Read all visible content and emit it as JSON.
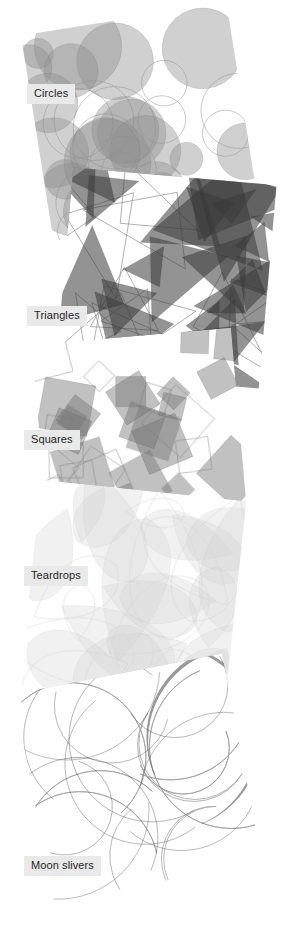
{
  "figure": {
    "background_color": "#ffffff",
    "width": 287,
    "height": 939,
    "label_chip": {
      "background_color": "#e9e9e9",
      "text_color": "#1f1f1f",
      "font_size_px": 11
    }
  },
  "panels": [
    {
      "id": "circles",
      "label": "Circles",
      "shape_kind": "circle",
      "tone": "medium-light",
      "fill_color": "#8f8f8f",
      "outline_color": "#707070",
      "shape_opacity": 0.42,
      "shape_count": 22,
      "rotation_deg": -9,
      "left": 36,
      "top": 18,
      "size": 208,
      "label_left": 27,
      "label_top": 84
    },
    {
      "id": "triangles",
      "label": "Triangles",
      "shape_kind": "triangle",
      "tone": "dark",
      "fill_color": "#3a3a3a",
      "outline_color": "#2a2a2a",
      "shape_opacity": 0.55,
      "shape_count": 26,
      "rotation_deg": 5,
      "left": 64,
      "top": 176,
      "size": 204,
      "label_left": 27,
      "label_top": 306
    },
    {
      "id": "squares",
      "label": "Squares",
      "shape_kind": "square",
      "tone": "medium",
      "fill_color": "#767676",
      "outline_color": "#5a5a5a",
      "shape_opacity": 0.45,
      "shape_count": 24,
      "rotation_deg": -5,
      "left": 40,
      "top": 336,
      "size": 200,
      "label_left": 24,
      "label_top": 430
    },
    {
      "id": "teardrops",
      "label": "Teardrops",
      "shape_kind": "teardrop",
      "tone": "very-light",
      "fill_color": "#cfcfcf",
      "outline_color": "#c4c4c4",
      "shape_opacity": 0.3,
      "shape_count": 20,
      "rotation_deg": 6,
      "left": 30,
      "top": 490,
      "size": 206,
      "label_left": 24,
      "label_top": 566
    },
    {
      "id": "moon-slivers",
      "label": "Moon slivers",
      "shape_kind": "sliver",
      "tone": "dark-medium",
      "fill_color": "#4b4b4b",
      "outline_color": "#3a3a3a",
      "shape_opacity": 0.55,
      "shape_count": 14,
      "rotation_deg": -11,
      "left": 32,
      "top": 672,
      "size": 212,
      "label_left": 24,
      "label_top": 856
    }
  ]
}
